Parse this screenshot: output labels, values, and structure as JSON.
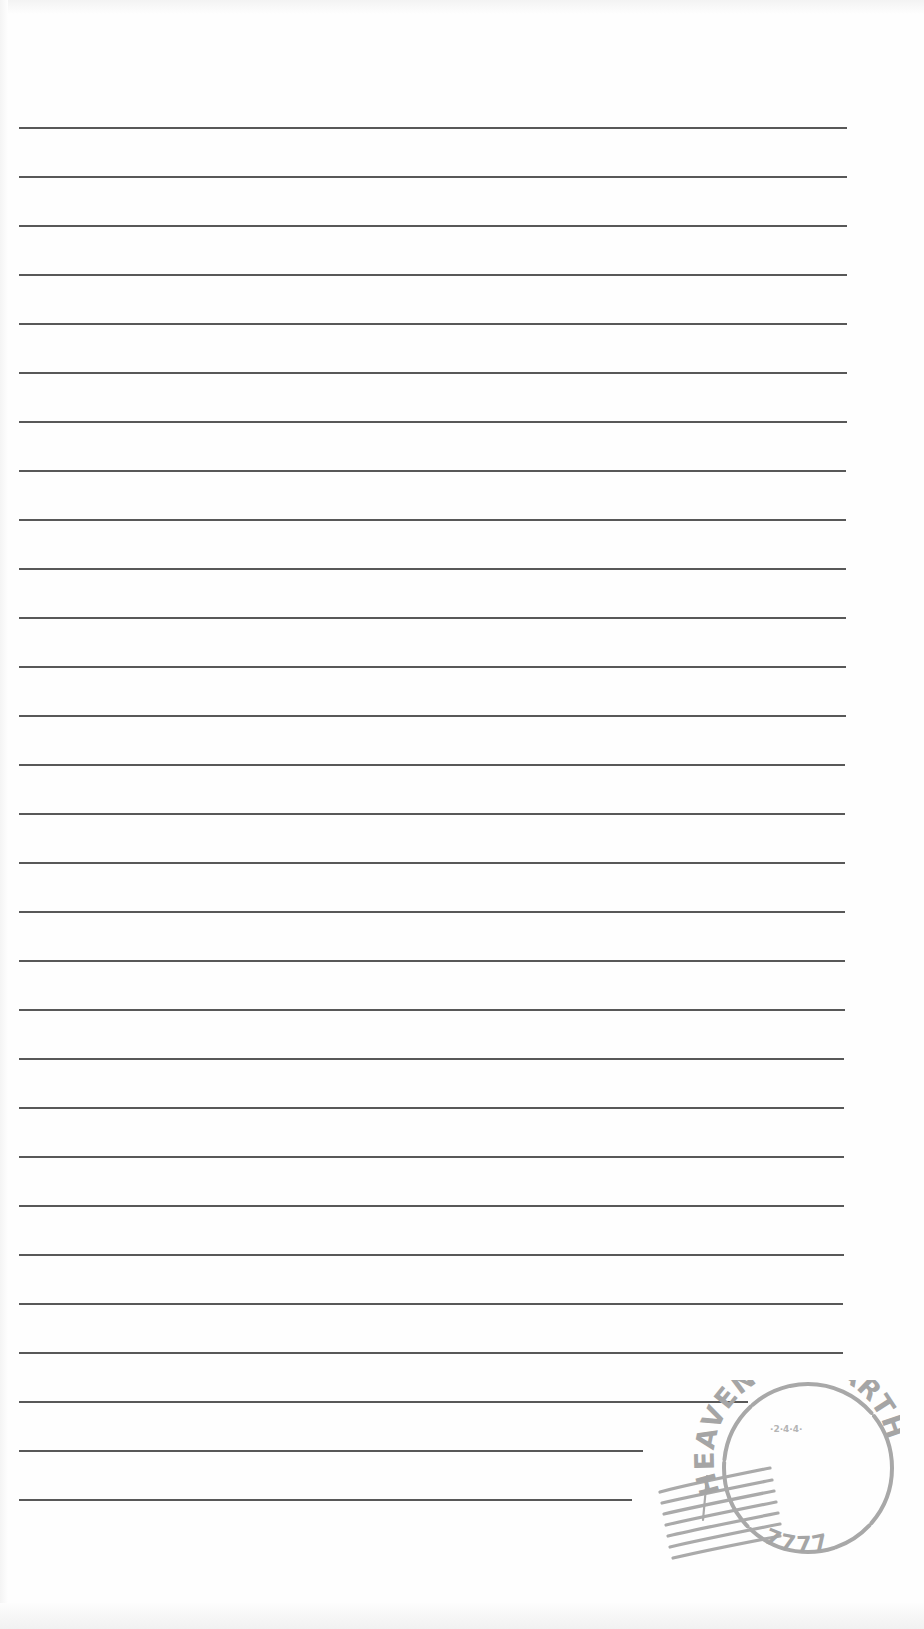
{
  "document": {
    "type": "lined-writing-paper",
    "line_color": "#4a4a4a",
    "stamp_color": "#a8a8a8",
    "lines": [
      {
        "y": 128,
        "x1": 19,
        "x2": 847
      },
      {
        "y": 177,
        "x1": 19,
        "x2": 847
      },
      {
        "y": 226,
        "x1": 19,
        "x2": 847
      },
      {
        "y": 275,
        "x1": 19,
        "x2": 847
      },
      {
        "y": 324,
        "x1": 19,
        "x2": 847
      },
      {
        "y": 373,
        "x1": 19,
        "x2": 847
      },
      {
        "y": 422,
        "x1": 19,
        "x2": 847
      },
      {
        "y": 471,
        "x1": 19,
        "x2": 846
      },
      {
        "y": 520,
        "x1": 19,
        "x2": 846
      },
      {
        "y": 569,
        "x1": 19,
        "x2": 846
      },
      {
        "y": 618,
        "x1": 19,
        "x2": 846
      },
      {
        "y": 667,
        "x1": 19,
        "x2": 846
      },
      {
        "y": 716,
        "x1": 19,
        "x2": 846
      },
      {
        "y": 765,
        "x1": 19,
        "x2": 845
      },
      {
        "y": 814,
        "x1": 19,
        "x2": 845
      },
      {
        "y": 863,
        "x1": 19,
        "x2": 845
      },
      {
        "y": 912,
        "x1": 19,
        "x2": 845
      },
      {
        "y": 961,
        "x1": 19,
        "x2": 845
      },
      {
        "y": 1010,
        "x1": 19,
        "x2": 845
      },
      {
        "y": 1059,
        "x1": 19,
        "x2": 844
      },
      {
        "y": 1108,
        "x1": 19,
        "x2": 844
      },
      {
        "y": 1157,
        "x1": 19,
        "x2": 844
      },
      {
        "y": 1206,
        "x1": 19,
        "x2": 844
      },
      {
        "y": 1255,
        "x1": 19,
        "x2": 844
      },
      {
        "y": 1304,
        "x1": 19,
        "x2": 843
      },
      {
        "y": 1353,
        "x1": 19,
        "x2": 843
      },
      {
        "y": 1402,
        "x1": 19,
        "x2": 748
      },
      {
        "y": 1451,
        "x1": 19,
        "x2": 643
      },
      {
        "y": 1500,
        "x1": 19,
        "x2": 632
      }
    ]
  },
  "postmark": {
    "top_text": "HEAVEN on EARTH",
    "bottom_text": "7777",
    "center_text": "·2·4·4·"
  }
}
